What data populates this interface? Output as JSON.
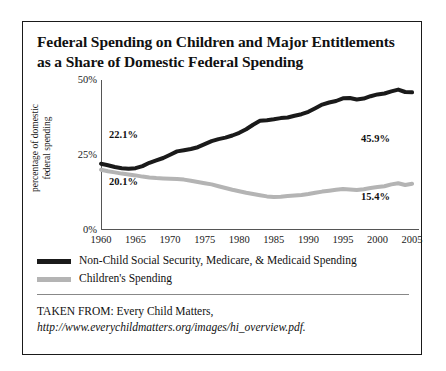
{
  "figure": {
    "title_line1": "Federal Spending on Children and Major Entitlements",
    "title_line2": "as a Share of Domestic Federal Spending",
    "source_prefix": "TAKEN FROM: Every Child Matters, ",
    "source_url": "http://www.everychildmatters.org/images/hi_overview.pdf."
  },
  "chart_data": {
    "type": "line",
    "title": "Federal Spending on Children and Major Entitlements as a Share of Domestic Federal Spending",
    "xlabel": "",
    "ylabel": "percentage of domestic federal spending",
    "ylabel_line1": "percentage of domestic",
    "ylabel_line2": "federal spending",
    "xlim": [
      1960,
      2006
    ],
    "ylim": [
      0,
      50
    ],
    "ytick_labels": [
      "50%",
      "25%",
      "0%"
    ],
    "ytick_values": [
      50,
      25,
      0
    ],
    "xtick_labels": [
      "1960",
      "1965",
      "1970",
      "1975",
      "1980",
      "1985",
      "1990",
      "1995",
      "2000",
      "2005"
    ],
    "xtick_values": [
      1960,
      1965,
      1970,
      1975,
      1980,
      1985,
      1990,
      1995,
      2000,
      2005
    ],
    "grid": false,
    "legend_position": "below-plot",
    "annotations": [
      {
        "text": "22.1%",
        "series": "Non-Child Social Security, Medicare, & Medicaid Spending",
        "x": 1960,
        "y": 22.1
      },
      {
        "text": "20.1%",
        "series": "Children's Spending",
        "x": 1960,
        "y": 20.1
      },
      {
        "text": "45.9%",
        "series": "Non-Child Social Security, Medicare, & Medicaid Spending",
        "x": 2005,
        "y": 45.9
      },
      {
        "text": "15.4%",
        "series": "Children's Spending",
        "x": 2005,
        "y": 15.4
      }
    ],
    "x": [
      1960,
      1961,
      1962,
      1963,
      1964,
      1965,
      1966,
      1967,
      1968,
      1969,
      1970,
      1971,
      1972,
      1973,
      1974,
      1975,
      1976,
      1977,
      1978,
      1979,
      1980,
      1981,
      1982,
      1983,
      1984,
      1985,
      1986,
      1987,
      1988,
      1989,
      1990,
      1991,
      1992,
      1993,
      1994,
      1995,
      1996,
      1997,
      1998,
      1999,
      2000,
      2001,
      2002,
      2003,
      2004,
      2005
    ],
    "series": [
      {
        "name": "Non-Child Social Security, Medicare, & Medicaid Spending",
        "color": "#1a1a1a",
        "values": [
          22.1,
          21.6,
          21.0,
          20.6,
          20.4,
          20.6,
          21.3,
          22.4,
          23.2,
          24.0,
          25.1,
          26.2,
          26.6,
          27.0,
          27.6,
          28.6,
          29.6,
          30.3,
          30.8,
          31.5,
          32.4,
          33.6,
          35.1,
          36.4,
          36.6,
          36.9,
          37.3,
          37.5,
          38.1,
          38.6,
          39.4,
          40.6,
          41.8,
          42.5,
          43.0,
          43.9,
          44.0,
          43.5,
          43.8,
          44.6,
          45.2,
          45.5,
          46.2,
          46.8,
          46.0,
          45.9
        ]
      },
      {
        "name": "Children's Spending",
        "color": "#b4b4b4",
        "values": [
          20.1,
          19.6,
          19.2,
          18.8,
          18.5,
          18.2,
          17.8,
          17.5,
          17.3,
          17.2,
          17.1,
          17.0,
          16.8,
          16.4,
          16.0,
          15.6,
          15.2,
          14.6,
          14.0,
          13.4,
          12.9,
          12.4,
          12.0,
          11.6,
          11.2,
          11.0,
          11.1,
          11.3,
          11.5,
          11.7,
          12.0,
          12.4,
          12.8,
          13.1,
          13.4,
          13.7,
          13.5,
          13.3,
          13.6,
          14.0,
          14.3,
          14.6,
          15.2,
          15.6,
          15.0,
          15.4
        ]
      }
    ]
  },
  "legend": {
    "items": [
      {
        "label": "Non-Child Social Security, Medicare, & Medicaid Spending",
        "color": "#1a1a1a"
      },
      {
        "label": "Children's Spending",
        "color": "#b4b4b4"
      }
    ]
  }
}
